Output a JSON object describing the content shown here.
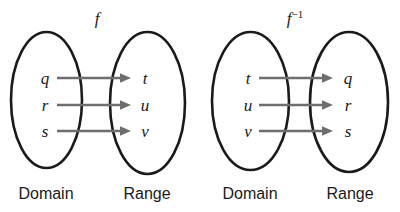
{
  "figure": {
    "background_color": "#ffffff",
    "ellipse_stroke_color": "#1a1a1a",
    "arrow_color": "#6e6e6e",
    "text_color": "#1a1a1a"
  },
  "diagrams": [
    {
      "id": "function-f",
      "map_label": "f",
      "map_label_superscript": "",
      "domain_label": "Domain",
      "range_label": "Range",
      "domain_elements": [
        "q",
        "r",
        "s"
      ],
      "range_elements": [
        "t",
        "u",
        "v"
      ],
      "mappings": [
        {
          "from": "q",
          "to": "t"
        },
        {
          "from": "r",
          "to": "u"
        },
        {
          "from": "s",
          "to": "v"
        }
      ]
    },
    {
      "id": "inverse-f",
      "map_label": "f",
      "map_label_superscript": "−1",
      "domain_label": "Domain",
      "range_label": "Range",
      "domain_elements": [
        "t",
        "u",
        "v"
      ],
      "range_elements": [
        "q",
        "r",
        "s"
      ],
      "mappings": [
        {
          "from": "t",
          "to": "q"
        },
        {
          "from": "u",
          "to": "r"
        },
        {
          "from": "v",
          "to": "s"
        }
      ]
    }
  ]
}
